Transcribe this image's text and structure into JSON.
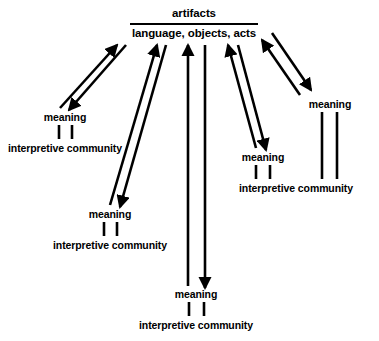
{
  "diagram": {
    "stroke_color": "#000000",
    "background_color": "#ffffff",
    "center_node": {
      "title": "artifacts",
      "subtitle": "language, objects, acts"
    },
    "branches": [
      {
        "id": "left-upper",
        "meaning_label": "meaning",
        "community_label": "interpretive community"
      },
      {
        "id": "left-lower",
        "meaning_label": "meaning",
        "community_label": "interpretive community"
      },
      {
        "id": "bottom-center",
        "meaning_label": "meaning",
        "community_label": "interpretive community"
      },
      {
        "id": "right-middle",
        "meaning_label": "meaning",
        "community_label": "interpretive community"
      },
      {
        "id": "right-upper",
        "meaning_label": "meaning",
        "community_label": ""
      }
    ]
  }
}
